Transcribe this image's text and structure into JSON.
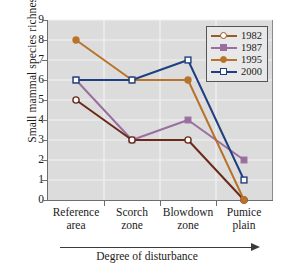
{
  "chart_data": {
    "type": "line",
    "title": "",
    "xlabel": "Degree of disturbance",
    "ylabel": "Small mammal species richness",
    "categories": [
      "Reference area",
      "Scorch zone",
      "Blowdown zone",
      "Pumice plain"
    ],
    "category_lines": [
      [
        "Reference",
        "area"
      ],
      [
        "Scorch",
        "zone"
      ],
      [
        "Blowdown",
        "zone"
      ],
      [
        "Pumice",
        "plain"
      ]
    ],
    "ylim": [
      0,
      9
    ],
    "yticks": [
      0,
      1,
      2,
      3,
      4,
      5,
      6,
      7,
      8,
      9
    ],
    "grid": true,
    "legend_position": "top-right",
    "series": [
      {
        "name": "1982",
        "values": [
          5,
          3,
          3,
          0
        ],
        "color": "#6b2a18",
        "marker": "open-circle",
        "legend_color": "#9a5a2a"
      },
      {
        "name": "1987",
        "values": [
          6,
          3,
          4,
          2
        ],
        "color": "#9a6fa0",
        "marker": "filled-square",
        "legend_color": "#9a6fa0"
      },
      {
        "name": "1995",
        "values": [
          8,
          6,
          6,
          0
        ],
        "color": "#b8732a",
        "marker": "filled-circle",
        "legend_color": "#b8732a"
      },
      {
        "name": "2000",
        "values": [
          6,
          6,
          7,
          1
        ],
        "color": "#1f3f80",
        "marker": "open-square",
        "legend_color": "#1f3f80"
      }
    ],
    "plot_background": "#dcdcdc",
    "gridline_color": "#f2f2f2"
  },
  "legend": {
    "entries": [
      "1982",
      "1987",
      "1995",
      "2000"
    ]
  }
}
